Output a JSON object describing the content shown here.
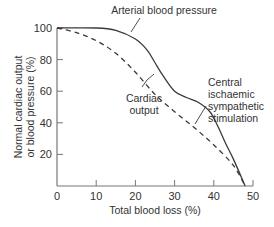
{
  "chart_data": {
    "type": "line",
    "title": "",
    "xlabel": "Total blood loss (%)",
    "ylabel_lines": [
      "Normal cardiac output",
      "or blood pressure (%)"
    ],
    "xlim": [
      0,
      50
    ],
    "ylim": [
      0,
      100
    ],
    "x_ticks": [
      0,
      10,
      20,
      30,
      40,
      50
    ],
    "x_tick_labels": [
      "0",
      "10",
      "20",
      "30",
      "40",
      "50"
    ],
    "y_ticks": [
      20,
      40,
      60,
      80,
      100
    ],
    "y_tick_labels": [
      "20",
      "40",
      "60",
      "80",
      "100"
    ],
    "grid": false,
    "legend": "none (inline annotations)",
    "series": [
      {
        "name": "Arterial blood pressure",
        "style": "solid",
        "x": [
          0,
          10,
          15,
          20,
          23,
          25,
          27,
          30,
          33,
          36,
          39,
          41,
          43,
          45,
          48
        ],
        "y": [
          100,
          100,
          98.5,
          93,
          86,
          78,
          70,
          60,
          56,
          53,
          47,
          38,
          27,
          17,
          0
        ]
      },
      {
        "name": "Cardiac output",
        "style": "dashed",
        "x": [
          0,
          5,
          10,
          15,
          20,
          25,
          30,
          35,
          40,
          45,
          48
        ],
        "y": [
          100,
          97,
          92,
          84,
          72,
          58,
          47,
          37,
          26,
          13,
          0
        ]
      }
    ],
    "annotations": [
      {
        "id": "arterial",
        "lines": [
          "Arterial blood pressure"
        ],
        "points_to_x": 23
      },
      {
        "id": "cardiac",
        "lines": [
          "Cardiac",
          "output"
        ],
        "points_to_x": 22
      },
      {
        "id": "central",
        "lines": [
          "Central",
          "ischaemic",
          "sympathetic",
          "stimulation"
        ],
        "points_to_x": 33
      }
    ]
  },
  "colors": {
    "axis": "#777777",
    "line": "#3a3a3a",
    "text": "#333333"
  }
}
